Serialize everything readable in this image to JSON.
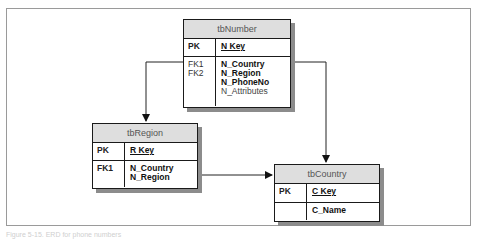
{
  "caption": "Figure 5-15. ERD for phone numbers",
  "tables": {
    "number": {
      "title": "tbNumber",
      "pk_label": "PK",
      "pk_field": "N Key",
      "fk_labels": [
        "FK1",
        "FK2"
      ],
      "fields": [
        "N_Country",
        "N_Region",
        "N_PhoneNo",
        "N_Attributes"
      ]
    },
    "region": {
      "title": "tbRegion",
      "pk_label": "PK",
      "pk_field": "R Key",
      "fk_labels": [
        "FK1"
      ],
      "fields": [
        "N_Country",
        "N_Region"
      ]
    },
    "country": {
      "title": "tbCountry",
      "pk_label": "PK",
      "pk_field": "C Key",
      "fk_labels": [],
      "fields": [
        "C_Name"
      ]
    }
  },
  "relationships": [
    {
      "from": "tbNumber",
      "to": "tbRegion"
    },
    {
      "from": "tbNumber",
      "to": "tbCountry"
    },
    {
      "from": "tbRegion",
      "to": "tbCountry"
    }
  ]
}
